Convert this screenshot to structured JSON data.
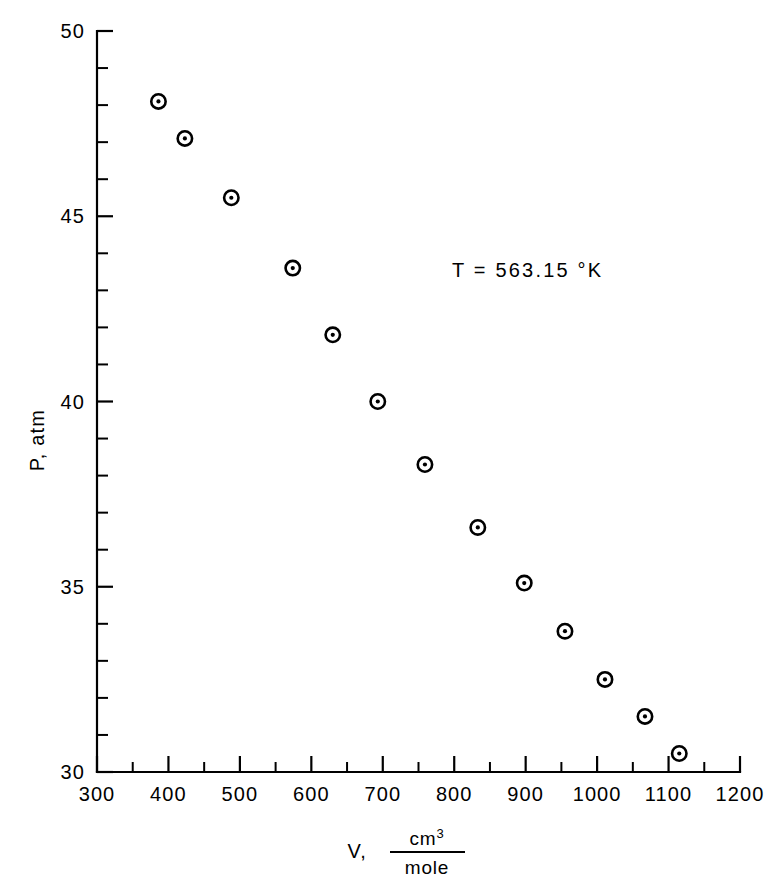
{
  "chart_data": {
    "type": "scatter",
    "title": "",
    "subtitle": "",
    "xlabel": "V, cm3/mole",
    "ylabel": "P, atm",
    "xlim": [
      300,
      1200
    ],
    "ylim": [
      30,
      50
    ],
    "grid": false,
    "legend": null,
    "x_major_step": 100,
    "x_minor_step": 50,
    "y_major_step": 5,
    "y_minor_step": 1,
    "x_tick_labels": [
      "300",
      "400",
      "500",
      "600",
      "700",
      "800",
      "900",
      "1000",
      "1100",
      "1200"
    ],
    "x_tick_values": [
      300,
      400,
      500,
      600,
      700,
      800,
      900,
      1000,
      1100,
      1200
    ],
    "y_tick_labels": [
      "30",
      "35",
      "40",
      "45",
      "50"
    ],
    "y_tick_values": [
      30,
      35,
      40,
      45,
      50
    ],
    "marker": "circle-with-center-dot",
    "series": [
      {
        "name": "isotherm-563K",
        "x": [
          386,
          423,
          488,
          574,
          630,
          693,
          759,
          833,
          898,
          955,
          1011,
          1067,
          1115
        ],
        "y": [
          48.1,
          47.1,
          45.5,
          43.6,
          41.8,
          40.0,
          38.3,
          36.6,
          35.1,
          33.8,
          32.5,
          31.5,
          30.5
        ]
      }
    ],
    "annotations": [
      {
        "text": "T = 563.15 °K",
        "x": 770,
        "y": 43.6
      }
    ]
  },
  "axis_labels": {
    "y_title": "P, atm",
    "x_title_variable": "V,",
    "x_title_numerator": "cm",
    "x_title_numerator_sup": "3",
    "x_title_denominator": "mole"
  },
  "annotation": {
    "temperature_label": "T = 563.15 °K"
  },
  "colors": {
    "background": "#ffffff",
    "axis": "#000000",
    "marker": "#000000",
    "text": "#000000"
  }
}
